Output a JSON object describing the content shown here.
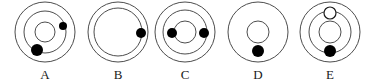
{
  "figure": {
    "title": "",
    "type": "atomic-shell-diagram-set",
    "background_color": "#ffffff",
    "stroke_color": "#4d4d4d",
    "dot_fill_color": "#000000",
    "hollow_fill_color": "#ffffff",
    "label_color": "#1a1a1a",
    "width": 378,
    "height": 84
  },
  "diagrams": [
    {
      "label": "A",
      "label_x": 45,
      "label_y": 68,
      "center_x": 45,
      "center_y": 32,
      "rings": [
        {
          "name": "outer-ring",
          "r": 30
        },
        {
          "name": "middle-ring",
          "r": 21
        },
        {
          "name": "nucleus-circle",
          "r": 10
        }
      ],
      "particles": [
        {
          "name": "small-electron",
          "cx": 63,
          "cy": 26,
          "r": 4,
          "fill": "solid"
        },
        {
          "name": "large-electron",
          "cx": 37,
          "cy": 50,
          "r": 6,
          "fill": "solid"
        }
      ]
    },
    {
      "label": "B",
      "label_x": 118,
      "label_y": 68,
      "center_x": 118,
      "center_y": 32,
      "rings": [
        {
          "name": "outer-ring",
          "r": 30
        },
        {
          "name": "inner-ring",
          "r": 24
        }
      ],
      "particles": [
        {
          "name": "electron",
          "cx": 141,
          "cy": 33,
          "r": 5,
          "fill": "solid"
        }
      ]
    },
    {
      "label": "C",
      "label_x": 185,
      "label_y": 68,
      "center_x": 185,
      "center_y": 32,
      "rings": [
        {
          "name": "outer-ring",
          "r": 30
        },
        {
          "name": "middle-ring",
          "r": 22
        },
        {
          "name": "nucleus-circle",
          "r": 11
        }
      ],
      "particles": [
        {
          "name": "left-electron",
          "cx": 172,
          "cy": 33,
          "r": 5,
          "fill": "solid"
        },
        {
          "name": "right-electron",
          "cx": 204,
          "cy": 33,
          "r": 5,
          "fill": "solid"
        }
      ]
    },
    {
      "label": "D",
      "label_x": 258,
      "label_y": 68,
      "center_x": 258,
      "center_y": 32,
      "rings": [
        {
          "name": "outer-ring",
          "r": 30
        },
        {
          "name": "nucleus-circle",
          "r": 11
        }
      ],
      "particles": [
        {
          "name": "electron",
          "cx": 258,
          "cy": 51,
          "r": 6,
          "fill": "solid"
        }
      ]
    },
    {
      "label": "E",
      "label_x": 330,
      "label_y": 68,
      "center_x": 330,
      "center_y": 32,
      "rings": [
        {
          "name": "outer-ring",
          "r": 30
        },
        {
          "name": "middle-ring",
          "r": 21
        },
        {
          "name": "nucleus-circle",
          "r": 11
        }
      ],
      "particles": [
        {
          "name": "hollow-electron",
          "cx": 330,
          "cy": 13,
          "r": 6,
          "fill": "hollow"
        },
        {
          "name": "solid-electron",
          "cx": 330,
          "cy": 51,
          "r": 6,
          "fill": "solid"
        }
      ]
    }
  ]
}
